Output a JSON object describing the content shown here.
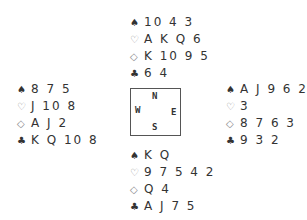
{
  "suits": {
    "spades": "♠",
    "hearts": "♡",
    "diamonds": "◇",
    "clubs": "♣"
  },
  "hands": {
    "north": {
      "spades": "10 4 3",
      "hearts": "A K Q 6",
      "diamonds": "K 10 9 5",
      "clubs": "6 4"
    },
    "west": {
      "spades": "8 7 5",
      "hearts": "J 10 8",
      "diamonds": "A J 2",
      "clubs": "K Q 10 8"
    },
    "east": {
      "spades": "A J 9 6 2",
      "hearts": "3",
      "diamonds": "8 7 6 3",
      "clubs": "9 3 2"
    },
    "south": {
      "spades": "K Q",
      "hearts": "9 7 5 4 2",
      "diamonds": "Q 4",
      "clubs": "A J 7 5"
    }
  },
  "compass": {
    "north": "N",
    "south": "S",
    "west": "W",
    "east": "E"
  }
}
